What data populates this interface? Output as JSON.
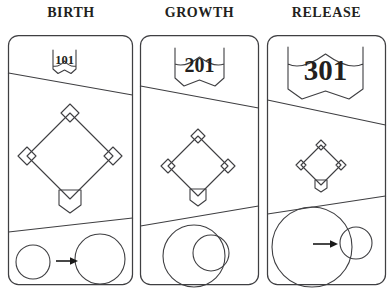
{
  "diagram": {
    "title_font_style": "serif-bold-uppercase",
    "line_color": "#3f3f42",
    "arrow_color": "#1a1a1a",
    "background": "#ffffff",
    "panels": [
      {
        "title": "BIRTH",
        "route_shield": {
          "number": "101",
          "size": "small"
        },
        "baseball_diamond": {
          "size": "large",
          "bases": 3,
          "home_plate": true
        },
        "circles": {
          "layout": "separate-with-arrow",
          "left_circle": "small",
          "right_circle": "large",
          "arrow": "right-arrow"
        }
      },
      {
        "title": "GROWTH",
        "route_shield": {
          "number": "201",
          "size": "medium"
        },
        "baseball_diamond": {
          "size": "medium",
          "bases": 3,
          "home_plate": true
        },
        "circles": {
          "layout": "nested-overlapping",
          "outer_circle": "large",
          "inner_circle": "medium",
          "arrow": "none"
        }
      },
      {
        "title": "RELEASE",
        "route_shield": {
          "number": "301",
          "size": "large"
        },
        "baseball_diamond": {
          "size": "small",
          "bases": 3,
          "home_plate": true
        },
        "circles": {
          "layout": "large-with-external-small",
          "main_circle": "extra-large",
          "satellite_circle": "small",
          "arrow": "right-arrow"
        }
      }
    ]
  }
}
